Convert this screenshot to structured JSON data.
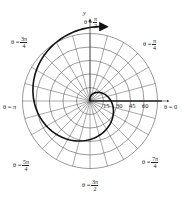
{
  "figure": {
    "type": "polar-graph",
    "center": {
      "x": 90,
      "y": 101
    },
    "ring_spacing_px": 13.5,
    "ring_count": 5,
    "spoke_count": 24,
    "grid_color": "#555555",
    "curve_color": "#111111",
    "axis_label_y": "y",
    "radial_ticks": [
      "15",
      "30",
      "45",
      "60"
    ],
    "angle_labels": [
      {
        "id": "pi-over-2",
        "prefix": "θ =",
        "num": "π",
        "den": "2"
      },
      {
        "id": "pi-over-4",
        "prefix": "θ =",
        "num": "π",
        "den": "4"
      },
      {
        "id": "3pi-over-4",
        "prefix": "θ =",
        "num": "3π",
        "den": "4"
      },
      {
        "id": "pi",
        "prefix": "θ = π"
      },
      {
        "id": "zero",
        "prefix": "θ = 0"
      },
      {
        "id": "5pi-over-4",
        "prefix": "θ =",
        "num": "5π",
        "den": "4"
      },
      {
        "id": "7pi-over-4",
        "prefix": "θ =",
        "num": "7π",
        "den": "4"
      },
      {
        "id": "3pi-over-2",
        "prefix": "θ =",
        "num": "3π",
        "den": "2"
      }
    ]
  },
  "chart_data": {
    "type": "line",
    "title": "",
    "radial_ticks": [
      15,
      30,
      45,
      60
    ],
    "rmax": 75,
    "angle_labels": [
      "θ = 0",
      "θ = π/4",
      "θ = π/2",
      "θ = 3π/4",
      "θ = π",
      "θ = 5π/4",
      "θ = 3π/2",
      "θ = 7π/4"
    ],
    "grid": true
  }
}
